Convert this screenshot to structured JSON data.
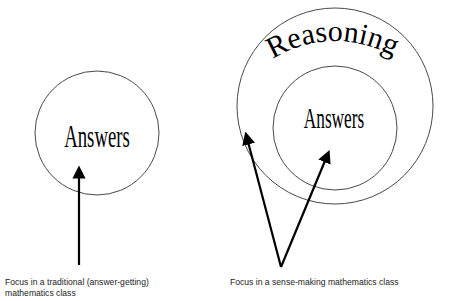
{
  "diagram": {
    "left": {
      "circle_label": "Answers",
      "caption": "Focus in a traditional (answer-getting) mathematics class"
    },
    "right": {
      "outer_circle_label": "Reasoning",
      "inner_circle_label": "Answers",
      "caption": "Focus in a sense-making mathematics class"
    },
    "colors": {
      "line": "#333333",
      "arrow": "#000000",
      "text": "#000000",
      "background": "#ffffff"
    }
  }
}
